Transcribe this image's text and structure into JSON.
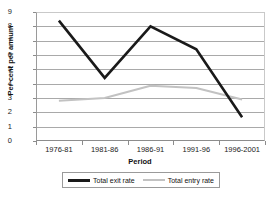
{
  "chart_data": {
    "type": "line",
    "title": "",
    "xlabel": "Period",
    "ylabel": "Per cent per annum",
    "categories": [
      "1976-81",
      "1981-86",
      "1986-91",
      "1991-96",
      "1996-2001"
    ],
    "series": [
      {
        "name": "Total exit rate",
        "values": [
          8.4,
          4.4,
          8.0,
          6.4,
          1.65
        ],
        "color": "#1a1a1a",
        "line_width": 2.6
      },
      {
        "name": "Total entry rate",
        "values": [
          2.8,
          3.0,
          3.85,
          3.7,
          2.9
        ],
        "color": "#c2c2c2",
        "line_width": 2.0
      }
    ],
    "ylim": [
      0,
      9
    ],
    "ytick_labels": [
      "0",
      "1",
      "2",
      "3",
      "4",
      "5",
      "6",
      "7",
      "8",
      "9"
    ],
    "grid": true,
    "legend_position": "bottom"
  },
  "legend": {
    "entries": [
      {
        "label": "Total exit rate"
      },
      {
        "label": "Total entry rate"
      }
    ]
  }
}
